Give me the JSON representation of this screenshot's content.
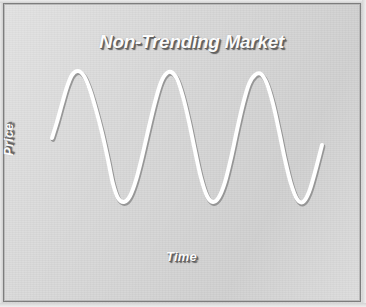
{
  "figure": {
    "title": "Non-Trending Market",
    "background_color": "#d8d8d8",
    "border_color": "#7d7d7d",
    "axis_color": "#ffffff",
    "curve_color": "#ffffff",
    "curve_shadow_color": "#8a8a8a",
    "label_color": "#fbfbfb",
    "label_shadow_color": "#5f5f5f"
  },
  "chart_data": {
    "type": "line",
    "title": "Non-Trending Market",
    "xlabel": "Time",
    "ylabel": "Price",
    "grid": false,
    "legend": null,
    "xticks": [],
    "yticks": [],
    "axes": {
      "x_axis_drawn": true,
      "y_axis_drawn": true,
      "x_axis_pixel_span": [
        31,
        338
      ],
      "y_axis_pixel_span": [
        25,
        241
      ]
    },
    "series": [
      {
        "name": "Price",
        "waveform": "sine",
        "cycles": 3,
        "amplitude": 64,
        "midline_y_pixel": 138,
        "peak_y_pixel": 74,
        "trough_y_pixel": 202,
        "start_point": [
          52,
          138
        ],
        "end_point": [
          322,
          145
        ],
        "peaks_x_pixel": [
          72,
          165,
          257
        ],
        "troughs_x_pixel": [
          115,
          207,
          300
        ],
        "points": [
          [
            52,
            138
          ],
          [
            57,
            122
          ],
          [
            62,
            104
          ],
          [
            67,
            87
          ],
          [
            72,
            75
          ],
          [
            78,
            71
          ],
          [
            84,
            76
          ],
          [
            90,
            90
          ],
          [
            96,
            110
          ],
          [
            102,
            133
          ],
          [
            108,
            160
          ],
          [
            113,
            184
          ],
          [
            118,
            198
          ],
          [
            124,
            202
          ],
          [
            130,
            196
          ],
          [
            136,
            180
          ],
          [
            142,
            157
          ],
          [
            148,
            131
          ],
          [
            154,
            106
          ],
          [
            160,
            85
          ],
          [
            165,
            75
          ],
          [
            171,
            72
          ],
          [
            177,
            79
          ],
          [
            183,
            97
          ],
          [
            189,
            122
          ],
          [
            195,
            151
          ],
          [
            201,
            178
          ],
          [
            207,
            196
          ],
          [
            213,
            202
          ],
          [
            219,
            197
          ],
          [
            225,
            182
          ],
          [
            231,
            158
          ],
          [
            237,
            130
          ],
          [
            243,
            104
          ],
          [
            249,
            84
          ],
          [
            255,
            75
          ],
          [
            261,
            74
          ],
          [
            267,
            84
          ],
          [
            273,
            104
          ],
          [
            279,
            131
          ],
          [
            285,
            160
          ],
          [
            291,
            184
          ],
          [
            297,
            199
          ],
          [
            303,
            202
          ],
          [
            309,
            192
          ],
          [
            315,
            172
          ],
          [
            322,
            145
          ]
        ]
      }
    ]
  }
}
